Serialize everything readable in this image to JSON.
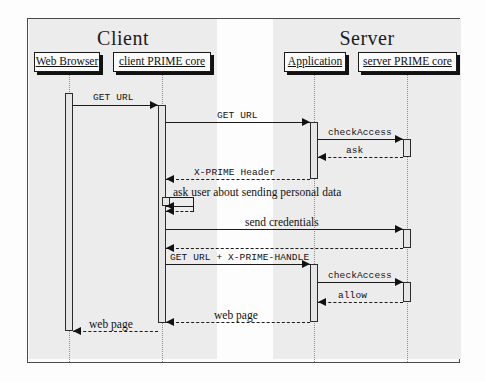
{
  "diagram": {
    "type": "uml-sequence-diagram",
    "partitions": [
      {
        "title": "Client",
        "x": 28,
        "width": 188
      },
      {
        "title": "Server",
        "x": 272,
        "width": 188
      }
    ],
    "lifelines": [
      {
        "id": "web-browser",
        "label": "Web Browser",
        "box_x": 33,
        "box_y": 51,
        "box_w": 66,
        "box_h": 20,
        "line_x": 68
      },
      {
        "id": "client-prime-core",
        "label": "client PRIME core",
        "box_x": 112,
        "box_y": 51,
        "box_w": 98,
        "box_h": 20,
        "line_x": 161
      },
      {
        "id": "application",
        "label": "Application",
        "box_x": 283,
        "box_y": 51,
        "box_w": 62,
        "box_h": 20,
        "line_x": 313
      },
      {
        "id": "server-prime-core",
        "label": "server PRIME core",
        "box_x": 357,
        "box_y": 51,
        "box_w": 99,
        "box_h": 20,
        "line_x": 406
      }
    ],
    "activations": [
      {
        "owner": "web-browser",
        "x": 64,
        "y": 92,
        "w": 8,
        "h": 238
      },
      {
        "owner": "client-prime-core",
        "x": 157,
        "y": 104,
        "w": 8,
        "h": 218
      },
      {
        "owner": "client-prime-core",
        "x": 161,
        "y": 196,
        "w": 8,
        "h": 9
      },
      {
        "owner": "application",
        "x": 309,
        "y": 121,
        "w": 8,
        "h": 57
      },
      {
        "owner": "application",
        "x": 309,
        "y": 263,
        "w": 8,
        "h": 58
      },
      {
        "owner": "server-prime-core",
        "x": 402,
        "y": 138,
        "w": 8,
        "h": 18
      },
      {
        "owner": "server-prime-core",
        "x": 402,
        "y": 228,
        "w": 8,
        "h": 19
      },
      {
        "owner": "server-prime-core",
        "x": 402,
        "y": 281,
        "w": 8,
        "h": 20
      }
    ],
    "messages": [
      {
        "id": "get-url-browser-to-core",
        "text": "GET URL",
        "font": "mono",
        "style": "solid",
        "direction": "right",
        "from_x": 72,
        "to_x": 157,
        "y": 104,
        "label_x": 92,
        "label_y": 92
      },
      {
        "id": "get-url-core-to-app",
        "text": "GET URL",
        "font": "mono",
        "style": "solid",
        "direction": "right",
        "from_x": 165,
        "to_x": 309,
        "y": 121,
        "label_x": 216,
        "label_y": 110
      },
      {
        "id": "check-access-1",
        "text": "checkAccess",
        "font": "mono",
        "style": "solid",
        "direction": "right",
        "from_x": 317,
        "to_x": 402,
        "y": 138,
        "label_x": 327,
        "label_y": 127
      },
      {
        "id": "ask-return",
        "text": "ask",
        "font": "mono",
        "style": "dashed",
        "direction": "left",
        "from_x": 402,
        "to_x": 317,
        "y": 156,
        "label_x": 345,
        "label_y": 145
      },
      {
        "id": "x-prime-header",
        "text": "X-PRIME Header",
        "font": "mono",
        "style": "dashed",
        "direction": "left",
        "from_x": 309,
        "to_x": 165,
        "y": 178,
        "label_x": 193,
        "label_y": 167
      },
      {
        "id": "ask-user-note",
        "text": "ask user about sending personal data",
        "font": "note",
        "style": "none",
        "direction": "none",
        "label_x": 172,
        "label_y": 186
      },
      {
        "id": "self-call-out",
        "text": "",
        "font": "mono",
        "style": "solid",
        "direction": "self",
        "from_x": 165,
        "to_x": 192,
        "y": 196,
        "label_x": 0,
        "label_y": 0
      },
      {
        "id": "self-call-return",
        "text": "",
        "font": "mono",
        "style": "dashed",
        "direction": "self-return",
        "from_x": 165,
        "to_x": 192,
        "y": 210,
        "label_x": 0,
        "label_y": 0
      },
      {
        "id": "send-credentials",
        "text": "send credentials",
        "font": "serif",
        "style": "solid",
        "direction": "right",
        "from_x": 165,
        "to_x": 402,
        "y": 228,
        "label_x": 244,
        "label_y": 216
      },
      {
        "id": "credentials-return",
        "text": "",
        "font": "mono",
        "style": "dashed",
        "direction": "left",
        "from_x": 402,
        "to_x": 165,
        "y": 247,
        "label_x": 0,
        "label_y": 0
      },
      {
        "id": "get-url-x-prime-handle",
        "text": "GET URL + X-PRIME-HANDLE",
        "font": "mono",
        "style": "solid",
        "direction": "right",
        "from_x": 165,
        "to_x": 309,
        "y": 263,
        "label_x": 169,
        "label_y": 252
      },
      {
        "id": "check-access-2",
        "text": "checkAccess",
        "font": "mono",
        "style": "solid",
        "direction": "right",
        "from_x": 317,
        "to_x": 402,
        "y": 281,
        "label_x": 327,
        "label_y": 270
      },
      {
        "id": "allow-return",
        "text": "allow",
        "font": "mono",
        "style": "dashed",
        "direction": "left",
        "from_x": 402,
        "to_x": 317,
        "y": 301,
        "label_x": 337,
        "label_y": 290
      },
      {
        "id": "web-page-app-to-core",
        "text": "web page",
        "font": "serif",
        "style": "dashed",
        "direction": "left",
        "from_x": 309,
        "to_x": 165,
        "y": 321,
        "label_x": 213,
        "label_y": 309
      },
      {
        "id": "web-page-core-to-browser",
        "text": "web page",
        "font": "serif",
        "style": "dashed",
        "direction": "left",
        "from_x": 157,
        "to_x": 72,
        "y": 330,
        "label_x": 88,
        "label_y": 318
      }
    ]
  }
}
